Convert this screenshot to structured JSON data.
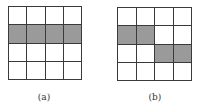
{
  "figures": [
    {
      "id": "a",
      "label": "(a)",
      "rows": 4,
      "cols": 4,
      "shaded_cells": [
        [
          1,
          0
        ],
        [
          1,
          1
        ],
        [
          1,
          2
        ],
        [
          1,
          3
        ]
      ]
    },
    {
      "id": "b",
      "label": "(b)",
      "rows": 4,
      "cols": 4,
      "shaded_cells": [
        [
          1,
          0
        ],
        [
          1,
          1
        ],
        [
          2,
          2
        ],
        [
          2,
          3
        ]
      ]
    }
  ],
  "colors": {
    "shaded": "#9a9a9a",
    "line": "#3a3a3a",
    "background": "#ffffff"
  }
}
